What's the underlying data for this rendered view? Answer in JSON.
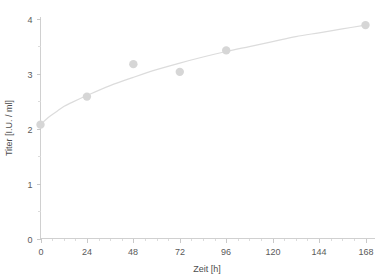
{
  "chart_data": {
    "type": "scatter",
    "title": "",
    "subtitle": "",
    "xlabel": "Zeit [h]",
    "ylabel": "Titer [I.U. / ml]",
    "xlim": [
      0,
      168
    ],
    "ylim": [
      0,
      4
    ],
    "grid": false,
    "legend": null,
    "x_ticks": [
      0,
      24,
      48,
      72,
      96,
      120,
      144,
      168
    ],
    "x_tick_labels": [
      "0",
      "24",
      "48",
      "72",
      "96",
      "120",
      "144",
      "168"
    ],
    "x_minor_interval": 6,
    "y_ticks": [
      0,
      1,
      2,
      3,
      4
    ],
    "y_tick_labels": [
      "0",
      "1",
      "2",
      "3",
      "4"
    ],
    "y_minor_interval": 0.5,
    "x": [
      0,
      24,
      48,
      72,
      96,
      168
    ],
    "values": [
      2.07,
      2.58,
      3.17,
      3.03,
      3.42,
      3.88
    ],
    "series": [
      {
        "name": "Titer",
        "marker": "circle",
        "color": "#d6d6d6",
        "points": [
          {
            "x": 0,
            "y": 2.07
          },
          {
            "x": 24,
            "y": 2.58
          },
          {
            "x": 48,
            "y": 3.17
          },
          {
            "x": 72,
            "y": 3.03
          },
          {
            "x": 96,
            "y": 3.42
          },
          {
            "x": 168,
            "y": 3.88
          }
        ]
      },
      {
        "name": "fit-curve",
        "marker": "none",
        "color": "#dcdcdc",
        "points": [
          {
            "x": 0,
            "y": 2.07
          },
          {
            "x": 4,
            "y": 2.2
          },
          {
            "x": 8,
            "y": 2.3
          },
          {
            "x": 12,
            "y": 2.4
          },
          {
            "x": 16,
            "y": 2.47
          },
          {
            "x": 24,
            "y": 2.6
          },
          {
            "x": 36,
            "y": 2.78
          },
          {
            "x": 48,
            "y": 2.93
          },
          {
            "x": 60,
            "y": 3.07
          },
          {
            "x": 72,
            "y": 3.19
          },
          {
            "x": 84,
            "y": 3.3
          },
          {
            "x": 96,
            "y": 3.4
          },
          {
            "x": 108,
            "y": 3.49
          },
          {
            "x": 120,
            "y": 3.58
          },
          {
            "x": 132,
            "y": 3.67
          },
          {
            "x": 144,
            "y": 3.74
          },
          {
            "x": 156,
            "y": 3.81
          },
          {
            "x": 168,
            "y": 3.88
          }
        ]
      }
    ]
  },
  "axes": {
    "x_title": "Zeit [h]",
    "y_title": "Titer [I.U. / ml]"
  },
  "colors": {
    "marker": "#d6d6d6",
    "curve": "#dcdcdc",
    "axis": "#d0d0d0",
    "text": "#5a5a5a",
    "background": "#ffffff"
  }
}
